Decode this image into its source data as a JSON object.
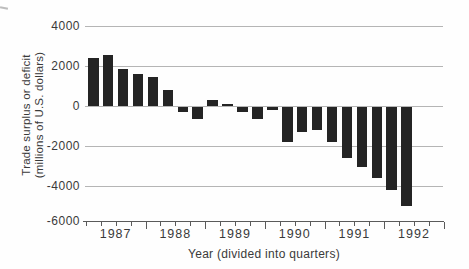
{
  "chart_data": {
    "type": "bar",
    "title": "",
    "xlabel": "Year (divided into quarters)",
    "ylabel": "Trade surplus or deficit (millions of U.S. dollars)",
    "ylabel_lines": [
      "Trade surplus or deficit",
      "(millions of U.S. dollars)"
    ],
    "ylim": [
      -6000,
      4000
    ],
    "yticks": [
      "4000",
      "2000",
      "0",
      "-2000",
      "-4000",
      "-6000"
    ],
    "ytick_values": [
      4000,
      2000,
      0,
      -2000,
      -4000,
      -6000
    ],
    "grid": true,
    "legend": "none",
    "years": [
      "1987",
      "1988",
      "1989",
      "1990",
      "1991",
      "1992"
    ],
    "quarters_per_year": 4,
    "categories": [
      "1987 Q1",
      "1987 Q2",
      "1987 Q3",
      "1987 Q4",
      "1988 Q1",
      "1988 Q2",
      "1988 Q3",
      "1988 Q4",
      "1989 Q1",
      "1989 Q2",
      "1989 Q3",
      "1989 Q4",
      "1990 Q1",
      "1990 Q2",
      "1990 Q3",
      "1990 Q4",
      "1991 Q1",
      "1991 Q2",
      "1991 Q3",
      "1991 Q4",
      "1992 Q1",
      "1992 Q2"
    ],
    "values": [
      2400,
      2550,
      1850,
      1600,
      1450,
      800,
      -250,
      -600,
      300,
      100,
      -250,
      -600,
      -150,
      -1750,
      -1250,
      -1150,
      -1750,
      -2550,
      -3000,
      -3550,
      -4150,
      -4950
    ]
  },
  "colors": {
    "bar": "#242424",
    "gridline": "#b5b5b5",
    "axis": "#5a5a5a",
    "text": "#3a3a3a",
    "background": "#fefefe"
  }
}
